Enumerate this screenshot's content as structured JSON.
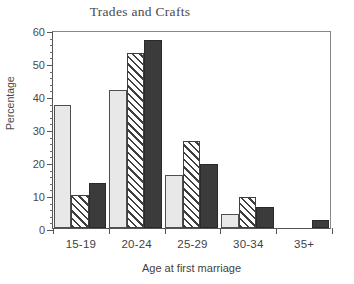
{
  "chart_data": {
    "type": "bar",
    "title": "Trades and Crafts",
    "xlabel": "Age at first marriage",
    "ylabel": "Percentage",
    "categories": [
      "15-19",
      "20-24",
      "25-29",
      "30-34",
      "35+"
    ],
    "series": [
      {
        "name": "series-1",
        "style": "light-gray-stipple",
        "values": [
          37.2,
          41.7,
          16.0,
          4.1,
          0
        ]
      },
      {
        "name": "series-2",
        "style": "diagonal-hatch",
        "values": [
          10.0,
          53.0,
          26.3,
          9.5,
          0
        ]
      },
      {
        "name": "series-3",
        "style": "solid-dark",
        "values": [
          13.5,
          57.0,
          19.3,
          6.5,
          2.3
        ]
      }
    ],
    "ylim": [
      0,
      60
    ],
    "ytick_labels": [
      "0",
      "10",
      "20",
      "30",
      "40",
      "50",
      "60"
    ],
    "ytick_values": [
      0,
      10,
      20,
      30,
      40,
      50,
      60
    ],
    "yminor_step": 2,
    "grid": false,
    "legend": "none",
    "colors": {
      "series1_fill": "#e8e8e8",
      "series2_fill": "#ffffff",
      "series3_fill": "#3b3b3b",
      "axis": "#555555",
      "text": "#3f3f3f"
    }
  }
}
